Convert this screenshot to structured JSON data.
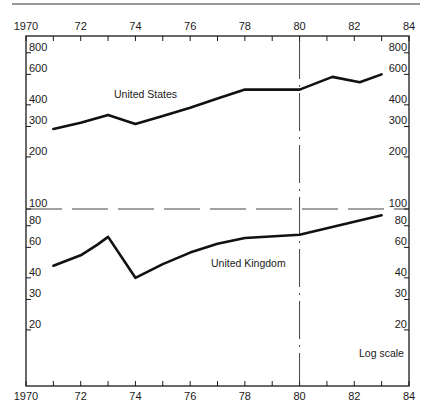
{
  "chart_data": {
    "type": "line",
    "title": "",
    "xlabel": "",
    "ylabel": "",
    "scale_note": "Log scale",
    "y_scale": "log",
    "xlim": [
      1970,
      1984
    ],
    "ylim": [
      10,
      1000
    ],
    "grid": false,
    "x_ticks": [
      1970,
      1971,
      1972,
      1973,
      1974,
      1975,
      1976,
      1977,
      1978,
      1979,
      1980,
      1981,
      1982,
      1983,
      1984
    ],
    "x_tick_labels": [
      {
        "x": 1970,
        "label": "1970"
      },
      {
        "x": 1972,
        "label": "72"
      },
      {
        "x": 1974,
        "label": "74"
      },
      {
        "x": 1976,
        "label": "76"
      },
      {
        "x": 1978,
        "label": "78"
      },
      {
        "x": 1980,
        "label": "80"
      },
      {
        "x": 1982,
        "label": "82"
      },
      {
        "x": 1984,
        "label": "84"
      }
    ],
    "y_tick_labels": [
      {
        "y": 800,
        "label": "800"
      },
      {
        "y": 600,
        "label": "600"
      },
      {
        "y": 400,
        "label": "400"
      },
      {
        "y": 300,
        "label": "300"
      },
      {
        "y": 200,
        "label": "200"
      },
      {
        "y": 100,
        "label": "100"
      },
      {
        "y": 80,
        "label": "80"
      },
      {
        "y": 60,
        "label": "60"
      },
      {
        "y": 40,
        "label": "40"
      },
      {
        "y": 30,
        "label": "30"
      },
      {
        "y": 20,
        "label": "20"
      }
    ],
    "reference_lines": [
      {
        "orientation": "horizontal",
        "value": 100,
        "style": "dashed"
      },
      {
        "orientation": "vertical",
        "value": 1980,
        "style": "dash-dot"
      }
    ],
    "series": [
      {
        "name": "United States",
        "x": [
          1971,
          1972,
          1973,
          1974,
          1975,
          1976,
          1977,
          1978,
          1979,
          1980,
          1981.2,
          1982.2,
          1983
        ],
        "values": [
          290,
          315,
          350,
          310,
          345,
          385,
          435,
          490,
          490,
          490,
          580,
          540,
          600
        ]
      },
      {
        "name": "United Kingdom",
        "x": [
          1971,
          1972,
          1972.6,
          1973,
          1974,
          1975,
          1976,
          1977,
          1978,
          1980,
          1983
        ],
        "values": [
          47,
          54,
          62,
          69,
          40,
          48,
          56,
          63,
          68,
          71,
          92
        ]
      }
    ]
  },
  "labels": {
    "us": "United States",
    "uk": "United Kingdom",
    "log_scale": "Log scale"
  }
}
